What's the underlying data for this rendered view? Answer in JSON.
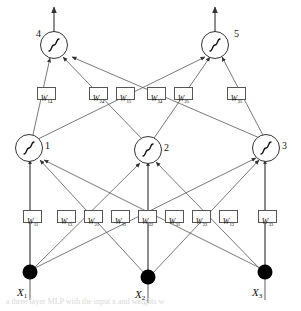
{
  "figure": {
    "caption": "a three layer MLP with the input x  and weights w",
    "colors": {
      "stroke": "#555555",
      "node_fill": "#ffffff",
      "input_fill": "#000000",
      "text": "#111111",
      "background": "#ffffff"
    }
  },
  "layers": {
    "input": {
      "nodes": [
        {
          "id": "x1",
          "label": "X",
          "sub": "1",
          "cx": 30,
          "cy": 272
        },
        {
          "id": "x2",
          "label": "X",
          "sub": "2",
          "cx": 148,
          "cy": 277
        },
        {
          "id": "x3",
          "label": "X",
          "sub": "3",
          "cx": 265,
          "cy": 272
        }
      ]
    },
    "hidden": {
      "nodes": [
        {
          "id": "h1",
          "number": "1",
          "glyph": "sigmoid",
          "cx": 29,
          "cy": 148
        },
        {
          "id": "h2",
          "number": "2",
          "glyph": "sigmoid",
          "cx": 148,
          "cy": 150
        },
        {
          "id": "h3",
          "number": "3",
          "glyph": "sigmoid",
          "cx": 266,
          "cy": 148
        }
      ]
    },
    "output": {
      "nodes": [
        {
          "id": "o4",
          "number": "4",
          "glyph": "sigmoid",
          "cx": 54,
          "cy": 45
        },
        {
          "id": "o5",
          "number": "5",
          "glyph": "sigmoid",
          "cx": 215,
          "cy": 45
        }
      ]
    }
  },
  "weights": {
    "input_to_hidden": [
      {
        "id": "w11a",
        "sym": "W",
        "sub": "11",
        "x": 23,
        "y": 210
      },
      {
        "id": "w13",
        "sym": "W",
        "sub": "13",
        "x": 57,
        "y": 210
      },
      {
        "id": "w21",
        "sym": "W",
        "sub": "21",
        "x": 84,
        "y": 210
      },
      {
        "id": "w11b",
        "sym": "W",
        "sub": "11",
        "x": 111,
        "y": 210
      },
      {
        "id": "w22",
        "sym": "W",
        "sub": "22",
        "x": 138,
        "y": 210
      },
      {
        "id": "w31",
        "sym": "W",
        "sub": "31",
        "x": 165,
        "y": 210
      },
      {
        "id": "w23",
        "sym": "W",
        "sub": "23",
        "x": 192,
        "y": 210
      },
      {
        "id": "w12",
        "sym": "W",
        "sub": "12",
        "x": 219,
        "y": 210
      },
      {
        "id": "w33",
        "sym": "W",
        "sub": "33",
        "x": 258,
        "y": 210
      }
    ],
    "hidden_to_output": [
      {
        "id": "w14",
        "sym": "W",
        "sub": "14",
        "x": 37,
        "y": 87
      },
      {
        "id": "w24",
        "sym": "W",
        "sub": "24",
        "x": 89,
        "y": 87
      },
      {
        "id": "w15",
        "sym": "W",
        "sub": "15",
        "x": 116,
        "y": 87
      },
      {
        "id": "w34",
        "sym": "W",
        "sub": "34",
        "x": 147,
        "y": 87
      },
      {
        "id": "w25",
        "sym": "W",
        "sub": "25",
        "x": 174,
        "y": 87
      },
      {
        "id": "w35",
        "sym": "W",
        "sub": "35",
        "x": 227,
        "y": 87
      }
    ]
  },
  "node_number_positions": [
    {
      "for": "o4",
      "text": "4",
      "x": 36,
      "y": 28
    },
    {
      "for": "o5",
      "text": "5",
      "x": 234,
      "y": 28
    },
    {
      "for": "h1",
      "text": "1",
      "x": 45,
      "y": 140
    },
    {
      "for": "h2",
      "text": "2",
      "x": 164,
      "y": 142
    },
    {
      "for": "h3",
      "text": "3",
      "x": 282,
      "y": 140
    }
  ]
}
